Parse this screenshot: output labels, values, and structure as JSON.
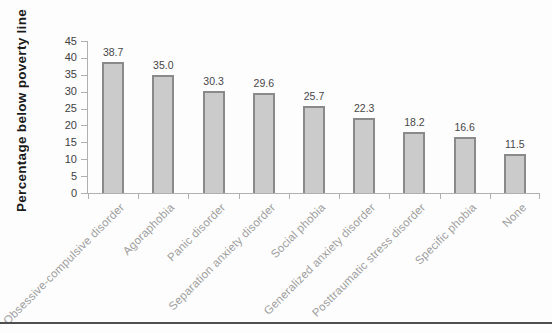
{
  "figure": {
    "background": "#fdfdfd",
    "bottom_rule_color": "#4f4f4f"
  },
  "chart_data": {
    "type": "bar",
    "title": "",
    "ylabel": "Percentage below poverty line",
    "xlabel": "",
    "ylim": [
      0,
      45
    ],
    "yticks": [
      0,
      5,
      10,
      15,
      20,
      25,
      30,
      35,
      40,
      45
    ],
    "grid": false,
    "legend": null,
    "categories": [
      "Obsessive-compulsive disorder",
      "Agoraphobia",
      "Panic disorder",
      "Separation anxiety disorder",
      "Social phobia",
      "Generalized anxiety disorder",
      "Posttraumatic stress disorder",
      "Specific phobia",
      "None"
    ],
    "values": [
      38.7,
      35.0,
      30.3,
      29.6,
      25.7,
      22.3,
      18.2,
      16.6,
      11.5
    ],
    "value_labels": [
      "38.7",
      "35.0",
      "30.3",
      "29.6",
      "25.7",
      "22.3",
      "18.2",
      "16.6",
      "11.5"
    ],
    "colors": {
      "bar_fill": "#cbcbcb",
      "bar_border": "#8a8a8a",
      "axis": "#b0b0b0",
      "tick_label": "#3f3f3f",
      "value_label": "#474747",
      "category_label": "#9d9d9d",
      "y_title": "#1b1b1b"
    }
  }
}
